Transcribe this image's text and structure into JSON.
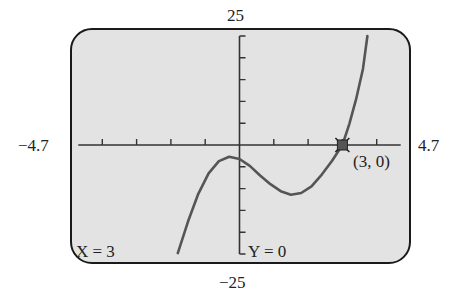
{
  "chart_data": {
    "type": "line",
    "title": "",
    "xlabel": "",
    "ylabel": "",
    "xlim": [
      -4.7,
      4.7
    ],
    "ylim": [
      -25,
      25
    ],
    "x_tick_step": 1,
    "y_tick_step": 5,
    "grid": false,
    "window_labels": {
      "xmin": "−4.7",
      "xmax": "4.7",
      "ymin": "−25",
      "ymax": "25"
    },
    "series": [
      {
        "name": "cubic function",
        "x": [
          -1.8,
          -1.5,
          -1.2,
          -0.9,
          -0.6,
          -0.3,
          0.0,
          0.3,
          0.6,
          0.9,
          1.2,
          1.5,
          1.8,
          2.1,
          2.4,
          2.7,
          3.0,
          3.2,
          3.4,
          3.6,
          3.73
        ],
        "y": [
          -24.8,
          -17.5,
          -11.2,
          -6.5,
          -3.7,
          -2.7,
          -3.2,
          -4.8,
          -7.0,
          -9.0,
          -10.6,
          -11.4,
          -11.0,
          -9.5,
          -6.8,
          -3.6,
          0.0,
          4.8,
          10.5,
          17.5,
          25.0
        ],
        "color": "#555555"
      }
    ],
    "annotations": [
      {
        "type": "trace-cursor",
        "x": 3,
        "y": 0,
        "label": "(3, 0)"
      }
    ],
    "readout": {
      "x": "X = 3",
      "y": "Y = 0"
    }
  },
  "labels": {
    "ymax": "25",
    "ymin": "−25",
    "xmin": "−4.7",
    "xmax": "4.7",
    "point": "(3, 0)",
    "readout_x": "X = 3",
    "readout_y": "Y = 0"
  },
  "colors": {
    "screen_bg": "#e3e3e3",
    "frame": "#1a1a1a",
    "curve": "#555555",
    "axes": "#333333",
    "cursor": "#555555"
  }
}
